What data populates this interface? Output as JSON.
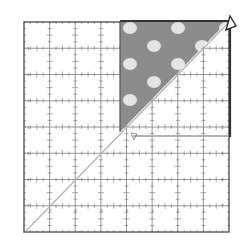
{
  "diagram": {
    "ruler": {
      "grid_squares": 8,
      "origin": [
        24,
        22
      ],
      "size": 205,
      "major_line_color": "#8a8a8a",
      "border_color": "#555555",
      "tick_color": "#777777",
      "row_labels": [
        "1",
        "2",
        "3",
        "4",
        "5",
        "6",
        "7",
        "8"
      ],
      "col_labels": [
        "8",
        "7",
        "6",
        "5",
        "4",
        "3",
        "2",
        "1"
      ]
    },
    "fabric_triangle": {
      "fill": "#8c8c8c",
      "dot_color": "#e4e4e4",
      "description": "Polka-dot half-square triangle aligned to top-right corner of ruler"
    },
    "diagonal_line": {
      "color": "#b0b0b0",
      "from": "bottom-left",
      "to": "top-right"
    },
    "highlight_box": {
      "border_color": "#333333",
      "inner_edge_color": "#9a9a9a"
    },
    "pointer": {
      "name": "corner-arrow",
      "color": "#333333"
    }
  }
}
